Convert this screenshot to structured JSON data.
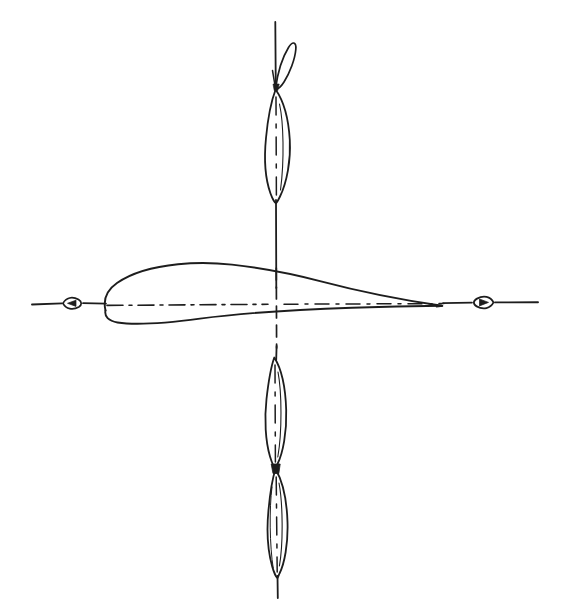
{
  "drawing": {
    "title": "Airfoil section with propeller blade sections",
    "background_color": "#ffffff",
    "ink_color": "#1d1d1d",
    "canvas": {
      "width": 567,
      "height": 608
    },
    "description": "Hand-drawn style engineering line drawing: a cambered wing airfoil cross-section lying on a horizontal centre axis, crossed by a vertical axis carrying three slender propeller-blade sections, the uppermost having a curled tip loop. Both ends of the horizontal axis carry small teardrop arrowhead markers.",
    "line_weights": {
      "axis": 1.6,
      "outline": 1.8,
      "centerline": 1.5,
      "thin": 1.2
    },
    "dash_patterns": {
      "chord_centerline": "16 6 3 6",
      "vertical_centerline": "12 7",
      "blade_centerline": "18 9 4 9"
    }
  },
  "axes": {
    "horizontal": {
      "label": "horizontal-axis",
      "y": 305,
      "x_start": 32,
      "x_end": 538
    },
    "vertical": {
      "label": "vertical-axis",
      "x": 276,
      "y_start": 22,
      "y_end": 598
    },
    "origin": {
      "x": 276,
      "y": 305
    }
  },
  "markers": {
    "left_arrowhead": {
      "name": "left-axis-arrow-marker",
      "center": {
        "x": 72,
        "y": 303
      },
      "direction": "left",
      "shape": "teardrop-with-inner-triangle"
    },
    "right_arrowhead": {
      "name": "right-axis-arrow-marker",
      "center": {
        "x": 483,
        "y": 302
      },
      "direction": "right",
      "shape": "teardrop-with-inner-triangle"
    }
  },
  "airfoil": {
    "name": "main-airfoil-section",
    "orientation": "horizontal",
    "leading_edge": {
      "x": 105,
      "y": 308
    },
    "trailing_edge": {
      "x": 442,
      "y": 306
    },
    "chord_length": 337,
    "max_thickness": 44,
    "max_thickness_x": 200,
    "upper_crest": {
      "x": 205,
      "y": 264
    },
    "camber": "cambered, near-flat lower surface",
    "chord_line": {
      "name": "airfoil-chord-centerline",
      "style": "dash-dot",
      "x_start": 80,
      "x_end": 470,
      "y": 304
    }
  },
  "blades": [
    {
      "name": "upper-blade-section",
      "index": 1,
      "position": "above horizontal axis",
      "tip_top": {
        "x": 276,
        "y": 88
      },
      "tip_bottom": {
        "x": 276,
        "y": 203
      },
      "length": 115,
      "max_width": 24,
      "max_width_y": 140,
      "has_centerline": true,
      "centerline_style": "dash-dot"
    },
    {
      "name": "lower-blade-section-upper",
      "index": 2,
      "position": "below horizontal axis",
      "tip_top": {
        "x": 274,
        "y": 357
      },
      "tip_bottom": {
        "x": 275,
        "y": 468
      },
      "length": 111,
      "max_width": 23,
      "max_width_y": 410,
      "has_centerline": true,
      "centerline_style": "dash-dot"
    },
    {
      "name": "lower-blade-section-lower",
      "index": 3,
      "position": "bottom of vertical axis",
      "tip_top": {
        "x": 276,
        "y": 469
      },
      "tip_bottom": {
        "x": 278,
        "y": 578
      },
      "length": 109,
      "max_width": 22,
      "max_width_y": 522,
      "has_centerline": true,
      "centerline_style": "dash-dot"
    }
  ],
  "tip_loop": {
    "name": "blade-tip-curl-loop",
    "description": "Narrow teardrop loop curling over to the right from the top of the upper blade section",
    "attach_point": {
      "x": 276,
      "y": 88
    },
    "apex": {
      "x": 293,
      "y": 40
    },
    "max_right_x": 296,
    "lean": "right"
  },
  "junction": {
    "name": "blade-root-junction",
    "point": {
      "x": 276,
      "y": 468
    },
    "description": "Dark filled junction where the two lower blade sections meet"
  }
}
